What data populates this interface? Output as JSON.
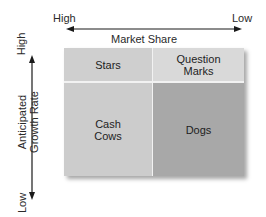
{
  "diagram": {
    "x_axis": {
      "label": "Market Share",
      "left_end": "High",
      "right_end": "Low"
    },
    "y_axis": {
      "label_line1": "Anticipated",
      "label_line2": "Growth Rate",
      "top_end": "High",
      "bottom_end": "Low"
    },
    "quadrants": [
      {
        "id": "stars",
        "label_line1": "Stars",
        "label_line2": "",
        "color": "#cfcfcf"
      },
      {
        "id": "question-marks",
        "label_line1": "Question",
        "label_line2": "Marks",
        "color": "#d9d9d9"
      },
      {
        "id": "cash-cows",
        "label_line1": "Cash",
        "label_line2": "Cows",
        "color": "#cccccc"
      },
      {
        "id": "dogs",
        "label_line1": "Dogs",
        "label_line2": "",
        "color": "#a8a8a8"
      }
    ]
  }
}
